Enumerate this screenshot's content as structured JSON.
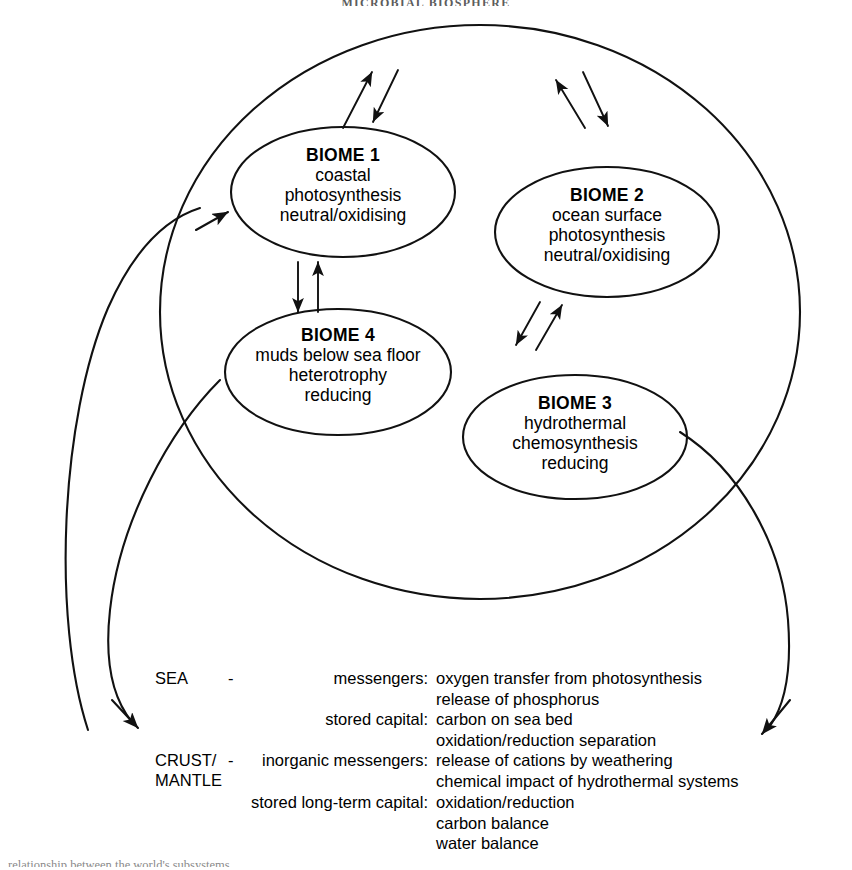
{
  "header": {
    "running_title": "MICROBIAL BIOSPHERE"
  },
  "bottom_caption": {
    "text": "relationship between the world's subsystems"
  },
  "diagram": {
    "outer_system_name": "global ocean system",
    "biomes": [
      {
        "id": "biome-1",
        "title": "BIOME 1",
        "lines": [
          "coastal",
          "photosynthesis",
          "neutral/oxidising"
        ]
      },
      {
        "id": "biome-2",
        "title": "BIOME 2",
        "lines": [
          "ocean surface",
          "photosynthesis",
          "neutral/oxidising"
        ]
      },
      {
        "id": "biome-3",
        "title": "BIOME 3",
        "lines": [
          "hydrothermal",
          "chemosynthesis",
          "reducing"
        ]
      },
      {
        "id": "biome-4",
        "title": "BIOME 4",
        "lines": [
          "muds below sea floor",
          "heterotrophy",
          "reducing"
        ]
      }
    ],
    "colors": {
      "line": "#111111",
      "background": "#ffffff",
      "text": "#000000"
    }
  },
  "legend": {
    "groups": [
      {
        "realm": "SEA",
        "dash": "-",
        "realm_line2": "",
        "rows": [
          {
            "kind": "messengers:",
            "items": [
              "oxygen transfer from photosynthesis",
              "release of phosphorus"
            ]
          },
          {
            "kind": "stored capital:",
            "items": [
              "carbon on sea bed",
              "oxidation/reduction separation"
            ]
          }
        ]
      },
      {
        "realm": "CRUST/",
        "dash": "-",
        "realm_line2": "MANTLE",
        "rows": [
          {
            "kind": "inorganic messengers:",
            "items": [
              "release of cations by weathering",
              "chemical impact of hydrothermal systems"
            ]
          },
          {
            "kind": "stored long-term capital:",
            "items": [
              "oxidation/reduction",
              "carbon balance",
              "water balance"
            ]
          }
        ]
      }
    ]
  }
}
